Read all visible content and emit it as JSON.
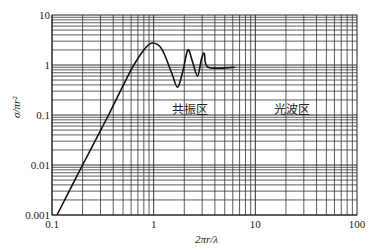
{
  "chart_data": {
    "type": "line",
    "title": "",
    "xlabel": "2πr/λ",
    "ylabel": "σ/πr²",
    "xscale": "log",
    "yscale": "log",
    "xlim": [
      0.1,
      100
    ],
    "ylim": [
      0.001,
      10
    ],
    "grid": true,
    "legend": null,
    "x_ticks": [
      "0.1",
      "1",
      "10",
      "100"
    ],
    "y_ticks": [
      "0.001",
      "0.01",
      "0.1",
      "1",
      "10"
    ],
    "series": [
      {
        "name": "scattering cross-section",
        "x": [
          0.112,
          0.2,
          0.36,
          0.6,
          0.8,
          0.97,
          1.2,
          1.5,
          1.72,
          1.95,
          2.17,
          2.4,
          2.7,
          2.95,
          3.15,
          3.45,
          6.3
        ],
        "y": [
          0.001,
          0.01,
          0.1,
          0.8,
          2.0,
          2.75,
          2.1,
          0.7,
          0.36,
          0.8,
          2.0,
          1.2,
          0.6,
          1.3,
          1.7,
          0.9,
          0.9
        ]
      }
    ],
    "annotations": [
      {
        "text": "共振区",
        "x": 1.7,
        "y": 0.055
      },
      {
        "text": "光波区",
        "x": 13,
        "y": 0.055
      }
    ]
  },
  "labels": {
    "xlabel": "2πr/λ",
    "ylabel": "σ/πr²",
    "region_resonance": "共振区",
    "region_optical": "光波区"
  },
  "colors": {
    "curve": "#111111",
    "grid": "#333333",
    "background": "#ffffff"
  }
}
